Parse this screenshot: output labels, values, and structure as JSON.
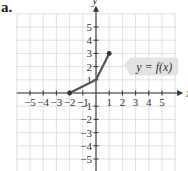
{
  "part_label": "a.",
  "chart_data": {
    "type": "line",
    "title": "",
    "xlabel": "x",
    "ylabel": "y",
    "xlim": [
      -6,
      6
    ],
    "ylim": [
      -6,
      6
    ],
    "grid": true,
    "x_ticks": [
      -5,
      -4,
      -3,
      -2,
      -1,
      1,
      2,
      3,
      4,
      5
    ],
    "y_ticks": [
      -5,
      -4,
      -3,
      -2,
      -1,
      1,
      2,
      3,
      4,
      5
    ],
    "series": [
      {
        "name": "y = f(x)",
        "points": [
          [
            -2,
            0
          ],
          [
            0,
            1
          ],
          [
            1,
            3
          ]
        ],
        "endpoints": [
          [
            -2,
            0
          ],
          [
            1,
            3
          ]
        ],
        "color": "#555555"
      }
    ],
    "annotations": [
      {
        "text": "y = f(x)",
        "x": 2.9,
        "y": 2
      }
    ]
  },
  "labels": {
    "x_axis": "x",
    "y_axis": "y",
    "function": "y = f(x)"
  },
  "colors": {
    "grid": "#d9d9d9",
    "axis": "#333333",
    "curve": "#555555",
    "label_bg": "#e3e3e3"
  }
}
